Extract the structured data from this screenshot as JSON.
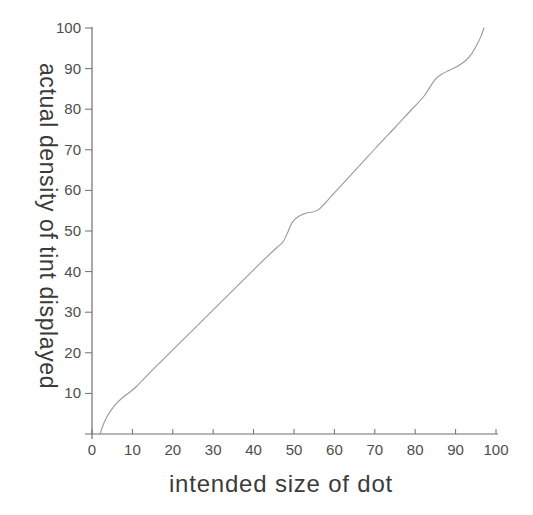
{
  "chart_data": {
    "type": "line",
    "title": "",
    "xlabel": "intended size of dot",
    "ylabel": "actual density of tint displayed",
    "xlim": [
      0,
      100
    ],
    "ylim": [
      0,
      100
    ],
    "xticks": [
      0,
      10,
      20,
      30,
      40,
      50,
      60,
      70,
      80,
      90,
      100
    ],
    "yticks": [
      10,
      20,
      30,
      40,
      50,
      60,
      70,
      80,
      90,
      100
    ],
    "grid": false,
    "legend_position": "none",
    "series": [
      {
        "name": "actual density of tint vs intended dot size",
        "points": [
          [
            2,
            0
          ],
          [
            2.6,
            1.8
          ],
          [
            3.5,
            3.8
          ],
          [
            4.6,
            5.7
          ],
          [
            6,
            7.5
          ],
          [
            7.6,
            9
          ],
          [
            9.3,
            10.3
          ],
          [
            11,
            11.7
          ],
          [
            15,
            15.8
          ],
          [
            21,
            21.7
          ],
          [
            28,
            28.6
          ],
          [
            35,
            35.5
          ],
          [
            41,
            41.4
          ],
          [
            45.5,
            45.7
          ],
          [
            47.2,
            47.2
          ],
          [
            48.3,
            49.3
          ],
          [
            49.5,
            52
          ],
          [
            51,
            53.5
          ],
          [
            53,
            54.4
          ],
          [
            56,
            55.2
          ],
          [
            60,
            59.4
          ],
          [
            65,
            64.8
          ],
          [
            70,
            70.2
          ],
          [
            75,
            75.5
          ],
          [
            79,
            79.8
          ],
          [
            82,
            83
          ],
          [
            83.5,
            85.2
          ],
          [
            85,
            87.4
          ],
          [
            86.5,
            88.6
          ],
          [
            88.5,
            89.6
          ],
          [
            90.5,
            90.6
          ],
          [
            92.5,
            92
          ],
          [
            94,
            93.7
          ],
          [
            95.3,
            95.9
          ],
          [
            96.3,
            98
          ],
          [
            97,
            100
          ]
        ]
      }
    ],
    "colors": {
      "background": "#ffffff",
      "curve": "#999999",
      "axis_line": "#6f6f6f",
      "tick_label": "#4d4d4d",
      "axis_title": "#3b3b3b"
    }
  }
}
